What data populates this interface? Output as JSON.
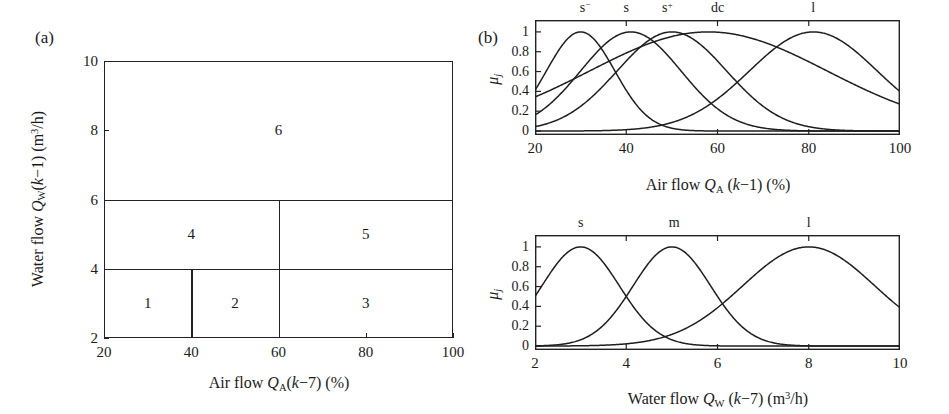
{
  "figure": {
    "panels": [
      {
        "key": "a",
        "label": "(a)"
      },
      {
        "key": "b",
        "label": "(b)"
      }
    ]
  },
  "panel_a": {
    "label": "(a)",
    "xtitle_prefix": "Air flow ",
    "xtitle_sym": "Q",
    "xtitle_sub": "A",
    "xtitle_arg": "(",
    "xtitle_k": "k",
    "xtitle_lag": "−7) (%)",
    "ytitle_prefix": "Water flow ",
    "ytitle_sym": "Q",
    "ytitle_sub": "W",
    "ytitle_k": "k",
    "ytitle_lag": "−1) (m",
    "ytitle_sup": "3",
    "ytitle_unit": "/h)",
    "xticks": [
      "20",
      "40",
      "60",
      "80",
      "100"
    ],
    "yticks": [
      "2",
      "4",
      "6",
      "8",
      "10"
    ],
    "xlim": [
      20,
      100
    ],
    "ylim": [
      2,
      10
    ],
    "regions": [
      {
        "id": "1",
        "label": "1",
        "x0": 20,
        "x1": 40,
        "y0": 2,
        "y1": 4
      },
      {
        "id": "2",
        "label": "2",
        "x0": 40,
        "x1": 60,
        "y0": 2,
        "y1": 4
      },
      {
        "id": "3",
        "label": "3",
        "x0": 60,
        "x1": 100,
        "y0": 2,
        "y1": 4
      },
      {
        "id": "4",
        "label": "4",
        "x0": 20,
        "x1": 60,
        "y0": 4,
        "y1": 6
      },
      {
        "id": "5",
        "label": "5",
        "x0": 60,
        "x1": 100,
        "y0": 4,
        "y1": 6
      },
      {
        "id": "6",
        "label": "6",
        "x0": 20,
        "x1": 100,
        "y0": 6,
        "y1": 10
      }
    ],
    "dividers": {
      "horizontal": [
        {
          "y": 4,
          "x0": 20,
          "x1": 100
        },
        {
          "y": 6,
          "x0": 20,
          "x1": 100
        }
      ],
      "vertical": [
        {
          "x": 40,
          "y0": 2,
          "y1": 4
        },
        {
          "x": 60,
          "y0": 2,
          "y1": 6
        }
      ]
    }
  },
  "panel_b": {
    "label": "(b)",
    "ylabel_mu": "μ",
    "ylabel_sub": "j"
  },
  "chart_data": [
    {
      "type": "line",
      "id": "air-flow-membership",
      "title": "",
      "xlabel": "Air flow Q_A (k−1) (%)",
      "ylabel": "μ_j",
      "xlim": [
        20,
        100
      ],
      "ylim": [
        -0.04,
        1.12
      ],
      "xticks": [
        20,
        40,
        60,
        80,
        100
      ],
      "xticklabels": [
        "20",
        "40",
        "60",
        "80",
        "100"
      ],
      "yticks": [
        0,
        0.2,
        0.4,
        0.6,
        0.8,
        1
      ],
      "yticklabels": [
        "0",
        "0.2",
        "0.4",
        "0.6",
        "0.8",
        "1"
      ],
      "grid": false,
      "legend": "inline-above-peaks",
      "series": [
        {
          "name": "s⁻",
          "label_html": "s<sup>−</sup>",
          "kind": "gaussian",
          "center": 30,
          "sigma": 7.5,
          "label_x": 31,
          "label_y": 1.1
        },
        {
          "name": "s",
          "label_html": "s",
          "kind": "gaussian",
          "center": 41,
          "sigma": 11.0,
          "label_x": 40,
          "label_y": 1.1
        },
        {
          "name": "s⁺",
          "label_html": "s<sup>+</sup>",
          "kind": "gaussian",
          "center": 50,
          "sigma": 12.0,
          "label_x": 49,
          "label_y": 1.1
        },
        {
          "name": "dc",
          "label_html": "dc",
          "kind": "gaussian",
          "center": 58,
          "sigma": 26.0,
          "label_x": 60,
          "label_y": 1.1
        },
        {
          "name": "l",
          "label_html": "l",
          "kind": "gaussian",
          "center": 81,
          "sigma": 14.0,
          "label_x": 81,
          "label_y": 1.1
        }
      ]
    },
    {
      "type": "line",
      "id": "water-flow-membership",
      "title": "",
      "xlabel": "Water flow Q_W (k−7) (m3/h)",
      "ylabel": "μ_j",
      "xlim": [
        2,
        10
      ],
      "ylim": [
        -0.04,
        1.12
      ],
      "xticks": [
        2,
        4,
        6,
        8,
        10
      ],
      "xticklabels": [
        "2",
        "4",
        "6",
        "8",
        "10"
      ],
      "yticks": [
        0,
        0.2,
        0.4,
        0.6,
        0.8,
        1
      ],
      "yticklabels": [
        "0",
        "0.2",
        "0.4",
        "0.6",
        "0.8",
        "1"
      ],
      "grid": false,
      "legend": "inline-above-peaks",
      "series": [
        {
          "name": "s",
          "label_html": "s",
          "kind": "gaussian",
          "center": 3,
          "sigma": 0.85,
          "label_x": 3.0,
          "label_y": 1.1
        },
        {
          "name": "m",
          "label_html": "m",
          "kind": "gaussian",
          "center": 5,
          "sigma": 0.85,
          "label_x": 5.05,
          "label_y": 1.1
        },
        {
          "name": "l",
          "label_html": "l",
          "kind": "gaussian",
          "center": 8,
          "sigma": 1.45,
          "label_x": 8.0,
          "label_y": 1.1
        }
      ]
    }
  ]
}
